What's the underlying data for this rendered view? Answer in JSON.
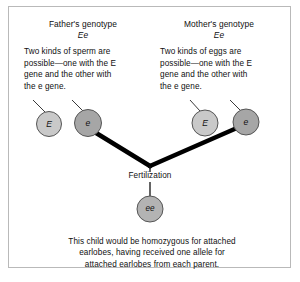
{
  "figure": {
    "background_color": "#ffffff",
    "frame_color": "#b9b9b9"
  },
  "father": {
    "heading": "Father's genotype",
    "genotype": "Ee",
    "description": "Two kinds of sperm are possible—one with the E gene and the other with the e gene.",
    "description_lines": [
      "Two kinds of sperm are",
      "possible—one with the E",
      "gene and the other with",
      "the e gene."
    ],
    "gametes": [
      {
        "label": "E",
        "allele": "dominant",
        "fill": "#c9c9c9"
      },
      {
        "label": "e",
        "allele": "recessive",
        "fill": "#a6a6a6"
      }
    ]
  },
  "mother": {
    "heading": "Mother's genotype",
    "genotype": "Ee",
    "description": "Two kinds of eggs are possible—one with the E gene and the other with the e gene.",
    "description_lines": [
      "Two kinds of eggs are",
      "possible—one with the E",
      "gene and the other with",
      "the e gene."
    ],
    "gametes": [
      {
        "label": "E",
        "allele": "dominant",
        "fill": "#c9c9c9"
      },
      {
        "label": "e",
        "allele": "recessive",
        "fill": "#a6a6a6"
      }
    ]
  },
  "fertilization": {
    "label": "Fertilization"
  },
  "zygote": {
    "label": "ee",
    "fill": "#b3b3b3",
    "caption": "This child would be homozygous for attached earlobes, having received one allele for attached earlobes from each parent.",
    "caption_lines": [
      "This child would be homozygous for attached",
      "earlobes, having received one allele for",
      "attached earlobes from each parent."
    ]
  },
  "colors": {
    "dominant_circle": "#c9c9c9",
    "recessive_circle": "#a6a6a6",
    "zygote_circle": "#b3b3b3",
    "circle_stroke": "#555555",
    "cross_line": "#000000",
    "leader_line": "#3a3a3a",
    "text": "#101010"
  }
}
